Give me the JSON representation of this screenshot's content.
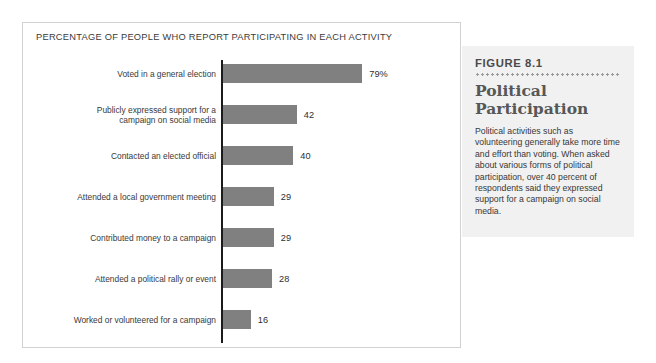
{
  "chart_panel": {
    "title": "PERCENTAGE OF PEOPLE WHO REPORT PARTICIPATING IN EACH ACTIVITY"
  },
  "figure": {
    "number": "FIGURE 8.1",
    "heading": "Political Participation",
    "caption": "Political activities such as volunteering generally take more time and effort than voting. When asked about various forms of political participation, over 40 percent of respondents said they expressed support for a campaign on social media."
  },
  "colors": {
    "bar": "#808080",
    "axis": "#1b1b1b",
    "panel_border": "#d2d2d2",
    "figure_box_background": "#f1f1f1",
    "figure_heading": "#575757"
  },
  "chart_data": {
    "type": "bar",
    "orientation": "horizontal",
    "title": "PERCENTAGE OF PEOPLE WHO REPORT PARTICIPATING IN EACH ACTIVITY",
    "xlabel": "",
    "ylabel": "",
    "xlim": [
      0,
      100
    ],
    "grid": false,
    "legend": false,
    "categories": [
      "Voted in a general election",
      "Publicly expressed support for a campaign on social media",
      "Contacted an elected official",
      "Attended a local government meeting",
      "Contributed money to a campaign",
      "Attended a political rally or event",
      "Worked or volunteered for a campaign"
    ],
    "values": [
      79,
      42,
      40,
      29,
      29,
      28,
      16
    ],
    "value_labels": [
      "79%",
      "42",
      "40",
      "29",
      "29",
      "28",
      "16"
    ],
    "label_lines": [
      [
        "Voted in a general election"
      ],
      [
        "Publicly expressed support for a",
        "campaign on social media"
      ],
      [
        "Contacted an elected official"
      ],
      [
        "Attended a local government meeting"
      ],
      [
        "Contributed money to a campaign"
      ],
      [
        "Attended a political rally or event"
      ],
      [
        "Worked or volunteered for a campaign"
      ]
    ]
  }
}
